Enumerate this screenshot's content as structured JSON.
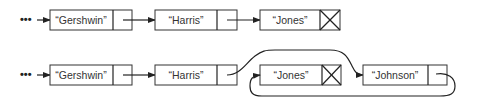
{
  "diagram": {
    "type": "linked-list-insertion",
    "continuation_marker": "•••",
    "before": {
      "nodes": [
        {
          "label": "“Gershwin”",
          "next": "pointer"
        },
        {
          "label": "“Harris”",
          "next": "pointer"
        },
        {
          "label": "“Jones”",
          "next": "null"
        }
      ]
    },
    "after": {
      "nodes": [
        {
          "label": "“Gershwin”",
          "next": "pointer"
        },
        {
          "label": "“Harris”",
          "next": "pointer to Johnson"
        },
        {
          "label": "“Jones”",
          "next": "null"
        },
        {
          "label": "“Johnson”",
          "next": "pointer to Jones"
        }
      ]
    },
    "colors": {
      "line": "#222222",
      "box_border": "#333333",
      "background": "#ffffff"
    }
  }
}
